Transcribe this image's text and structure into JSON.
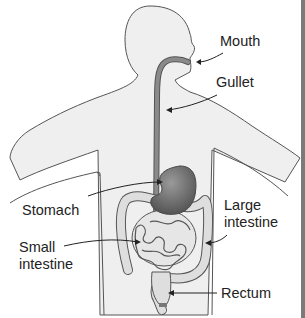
{
  "diagram": {
    "labels": {
      "mouth": "Mouth",
      "gullet": "Gullet",
      "stomach": "Stomach",
      "large_intestine_line1": "Large",
      "large_intestine_line2": "intestine",
      "small_intestine_line1": "Small",
      "small_intestine_line2": "intestine",
      "rectum": "Rectum"
    },
    "colors": {
      "body_fill": "#efefef",
      "outline": "#555555",
      "organ_dark": "#6a6a6a",
      "organ_light": "#dcdcdc",
      "text": "#222222",
      "frame_border": "#7a7a7a"
    }
  }
}
